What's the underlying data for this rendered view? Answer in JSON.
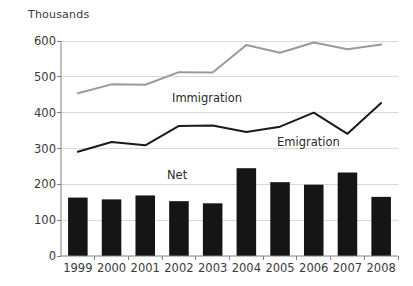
{
  "chart": {
    "axis_title": "Thousands",
    "background_color": "#ffffff",
    "grid_color": "#d9d9d9",
    "axis_color": "#808080",
    "text_color": "#3a3a3a"
  },
  "labels": {
    "immigration": "Immigration",
    "emigration": "Emigration",
    "net": "Net"
  },
  "chart_data": {
    "type": "bar",
    "title": "Thousands",
    "subtitle": "",
    "xlabel": "",
    "ylabel": "Thousands",
    "ylim": [
      0,
      600
    ],
    "ytick_values": [
      0,
      100,
      200,
      300,
      400,
      500,
      600
    ],
    "ytick_labels": [
      "0",
      "100",
      "200",
      "300",
      "400",
      "500",
      "600"
    ],
    "grid": true,
    "legend_position": "inline-annotations",
    "categories": [
      "1999",
      "2000",
      "2001",
      "2002",
      "2003",
      "2004",
      "2005",
      "2006",
      "2007",
      "2008"
    ],
    "series": [
      {
        "name": "Immigration",
        "type": "line",
        "color": "#9a9a9a",
        "line_width": 2,
        "values": [
          454,
          479,
          478,
          513,
          512,
          589,
          567,
          596,
          577,
          590
        ]
      },
      {
        "name": "Emigration",
        "type": "line",
        "color": "#1a1a1a",
        "line_width": 2,
        "values": [
          291,
          318,
          309,
          363,
          364,
          346,
          361,
          400,
          341,
          427
        ]
      },
      {
        "name": "Net",
        "type": "bar",
        "color": "#151515",
        "values": [
          163,
          158,
          169,
          153,
          147,
          245,
          206,
          199,
          233,
          165
        ]
      }
    ],
    "annotations": [
      {
        "text": "Immigration",
        "series": "Immigration"
      },
      {
        "text": "Emigration",
        "series": "Emigration"
      },
      {
        "text": "Net",
        "series": "Net"
      }
    ]
  }
}
